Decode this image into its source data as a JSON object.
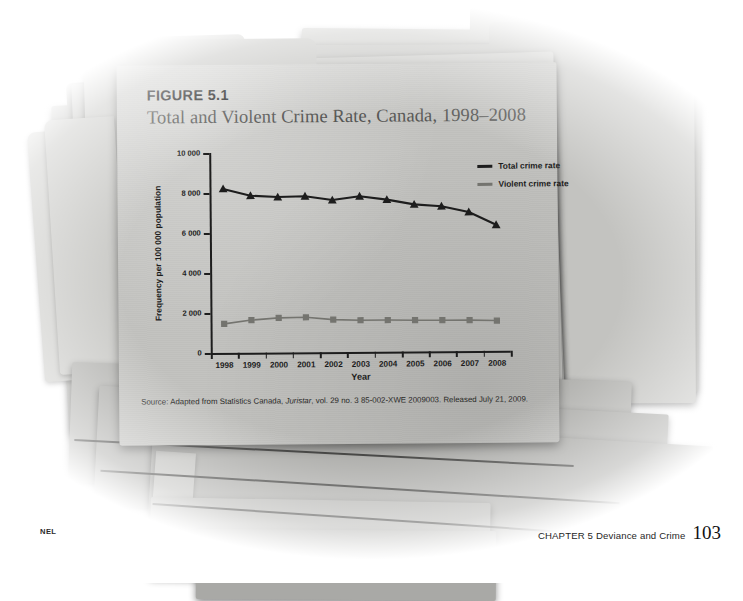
{
  "figure": {
    "number": "FIGURE 5.1",
    "title": "Total and Violent Crime Rate, Canada, 1998–2008",
    "source": "Source: Adapted from Statistics Canada, Juristar, vol. 29 no. 3 85-002-XWE 2009003. Released July 21, 2009.",
    "source_italic_part": "Juristar"
  },
  "footer": {
    "publisher": "NEL",
    "chapter": "CHAPTER 5  Deviance and Crime",
    "page": "103"
  },
  "colors": {
    "total_series": "#1d1d1d",
    "violent_series": "#74746f",
    "folder": "#c2c2bf",
    "title_text": "#565654",
    "axis": "#1d1d1d"
  },
  "chart_data": {
    "type": "line",
    "title": "Total and Violent Crime Rate, Canada, 1998–2008",
    "xlabel": "Year",
    "ylabel": "Frequency per 100 000 population",
    "x": [
      "1998",
      "1999",
      "2000",
      "2001",
      "2002",
      "2003",
      "2004",
      "2005",
      "2006",
      "2007",
      "2008"
    ],
    "ytick_labels": [
      "0",
      "2 000",
      "4 000",
      "6 000",
      "8 000",
      "10 000"
    ],
    "ytick_values": [
      0,
      2000,
      4000,
      6000,
      8000,
      10000
    ],
    "ylim": [
      0,
      10000
    ],
    "grid": false,
    "legend_position": "top-right",
    "series": [
      {
        "name": "Total crime rate",
        "marker": "triangle",
        "color": "#1d1d1d",
        "values": [
          8200,
          7850,
          7770,
          7800,
          7600,
          7780,
          7600,
          7350,
          7250,
          6950,
          6300
        ]
      },
      {
        "name": "Violent crime rate",
        "marker": "square",
        "color": "#74746f",
        "values": [
          1450,
          1630,
          1730,
          1750,
          1620,
          1580,
          1580,
          1560,
          1550,
          1540,
          1510
        ]
      }
    ]
  }
}
